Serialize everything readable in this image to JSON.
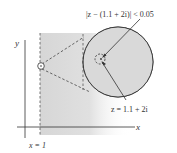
{
  "diagram": {
    "labels": {
      "y_axis": "y",
      "x_axis": "x",
      "line": "x = 1",
      "neighborhood": "|z − (1.1 + 2i)| < 0.05",
      "point": "z = 1.1 + 2i"
    },
    "colors": {
      "shade": "#d9d9d9",
      "line": "#333333",
      "background": "#ffffff"
    }
  }
}
